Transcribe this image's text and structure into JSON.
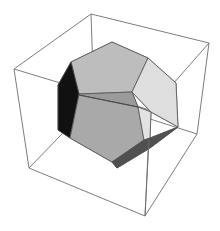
{
  "figure": {
    "width": 220,
    "height": 231,
    "colors": {
      "background": "#ffffff",
      "box_edge": "#6e6e6e",
      "face_edge": "#555555",
      "top_face": "#bdbdbd",
      "front_face": "#a9a9a9",
      "band_face": "#9b9b9b",
      "right_face": "#dedede",
      "lower_right_face": "#e2e2e2",
      "left_face": "#111111",
      "bottom_face": "#505050"
    },
    "box_back_edges": [
      [
        [
          91,
          14
        ],
        [
          94,
          101
        ]
      ],
      [
        [
          29,
          168
        ],
        [
          94,
          101
        ]
      ],
      [
        [
          197,
          134
        ],
        [
          94,
          101
        ]
      ]
    ],
    "box_front_edges": [
      [
        [
          91,
          14
        ],
        [
          209,
          43
        ]
      ],
      [
        [
          91,
          14
        ],
        [
          14,
          69
        ]
      ],
      [
        [
          14,
          69
        ],
        [
          29,
          168
        ]
      ],
      [
        [
          29,
          168
        ],
        [
          145,
          216
        ]
      ],
      [
        [
          145,
          216
        ],
        [
          197,
          134
        ]
      ],
      [
        [
          197,
          134
        ],
        [
          209,
          43
        ]
      ],
      [
        [
          14,
          69
        ],
        [
          150,
          110
        ]
      ],
      [
        [
          209,
          43
        ],
        [
          150,
          110
        ]
      ],
      [
        [
          150,
          110
        ],
        [
          145,
          216
        ]
      ]
    ],
    "faces": [
      {
        "name": "top-face",
        "fill": "top_face",
        "points": [
          [
            112,
            42
          ],
          [
            148,
            58
          ],
          [
            132,
            92
          ],
          [
            79,
            94
          ],
          [
            71,
            62
          ]
        ]
      },
      {
        "name": "band-face",
        "fill": "band_face",
        "points": [
          [
            79,
            94
          ],
          [
            132,
            92
          ],
          [
            138,
            107
          ],
          [
            79,
            95
          ]
        ]
      },
      {
        "name": "right-face",
        "fill": "right_face",
        "points": [
          [
            148,
            58
          ],
          [
            176,
            83
          ],
          [
            178,
            127
          ],
          [
            151,
            112
          ],
          [
            132,
            92
          ]
        ]
      },
      {
        "name": "left-face",
        "fill": "left_face",
        "points": [
          [
            71,
            62
          ],
          [
            79,
            94
          ],
          [
            70,
            138
          ],
          [
            58,
            130
          ],
          [
            58,
            85
          ]
        ]
      },
      {
        "name": "front-face",
        "fill": "front_face",
        "points": [
          [
            79,
            95
          ],
          [
            138,
            107
          ],
          [
            144,
            140
          ],
          [
            112,
            162
          ],
          [
            70,
            138
          ]
        ]
      },
      {
        "name": "lower-right-face",
        "fill": "lower_right_face",
        "points": [
          [
            138,
            107
          ],
          [
            151,
            112
          ],
          [
            150,
            138
          ],
          [
            144,
            140
          ]
        ]
      },
      {
        "name": "bottom-face",
        "fill": "bottom_face",
        "points": [
          [
            144,
            140
          ],
          [
            150,
            138
          ],
          [
            178,
            127
          ],
          [
            150,
            148
          ],
          [
            117,
            168
          ],
          [
            112,
            162
          ]
        ]
      }
    ]
  }
}
